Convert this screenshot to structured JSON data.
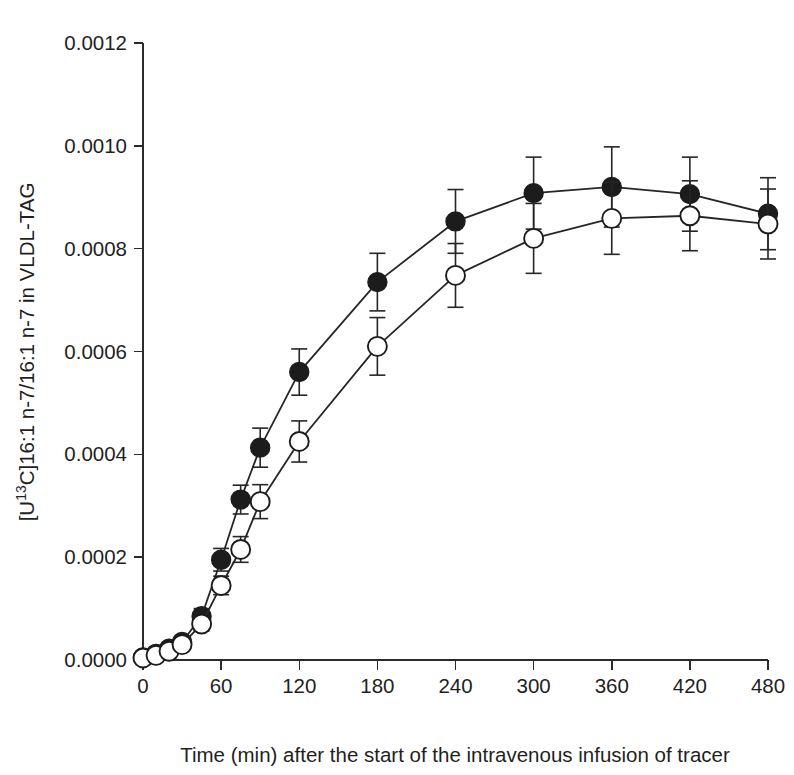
{
  "figure": {
    "background_color": "#ffffff",
    "line_color": "#262626",
    "axis_color": "#2b2b2b",
    "filled_marker_color": "#1c1c1c",
    "open_marker_fill": "#ffffff"
  },
  "chart_data": {
    "type": "line",
    "title": "",
    "subtitle": "",
    "xlabel": "Time (min) after the start of the intravenous infusion of tracer",
    "ylabel": "[U13C]16:1 n-7/16:1 n-7 in VLDL-TAG",
    "ylabel_parts": {
      "prefix": "[U",
      "superscript": "13",
      "suffix": "C]16:1 n-7/16:1 n-7 in VLDL-TAG"
    },
    "xlim": [
      0,
      480
    ],
    "ylim": [
      0.0,
      0.0012
    ],
    "grid": false,
    "legend_position": "none",
    "xticks": [
      0,
      60,
      120,
      180,
      240,
      300,
      360,
      420,
      480
    ],
    "xtick_labels": [
      "0",
      "60",
      "120",
      "180",
      "240",
      "300",
      "360",
      "420",
      "480"
    ],
    "yticks": [
      0.0,
      0.0002,
      0.0004,
      0.0006,
      0.0008,
      0.001,
      0.0012
    ],
    "ytick_labels": [
      "0.0000",
      "0.0002",
      "0.0004",
      "0.0006",
      "0.0008",
      "0.0010",
      "0.0012"
    ],
    "x": [
      0,
      10,
      20,
      30,
      45,
      60,
      75,
      90,
      120,
      180,
      240,
      300,
      360,
      420,
      480
    ],
    "series": [
      {
        "name": "filled-circles",
        "marker": "filled-circle",
        "values": [
          5e-06,
          1.2e-05,
          2.2e-05,
          3.5e-05,
          8.5e-05,
          0.000195,
          0.000312,
          0.000413,
          0.00056,
          0.000735,
          0.000853,
          0.000908,
          0.00092,
          0.000906,
          0.000868
        ],
        "errors": [
          0.0,
          0.0,
          0.0,
          0.0,
          1.5e-05,
          2.2e-05,
          2.8e-05,
          3.8e-05,
          4.5e-05,
          5.6e-05,
          6.2e-05,
          7e-05,
          7.8e-05,
          7.2e-05,
          7e-05
        ]
      },
      {
        "name": "open-circles",
        "marker": "open-circle",
        "values": [
          4e-06,
          9e-06,
          1.7e-05,
          3e-05,
          7e-05,
          0.000145,
          0.000215,
          0.000308,
          0.000425,
          0.00061,
          0.000748,
          0.00082,
          0.000859,
          0.000864,
          0.000848
        ],
        "errors": [
          0.0,
          0.0,
          0.0,
          0.0,
          1.3e-05,
          1.8e-05,
          2.5e-05,
          3.3e-05,
          4e-05,
          5.6e-05,
          6.2e-05,
          6.8e-05,
          7e-05,
          6.8e-05,
          6.8e-05
        ]
      }
    ]
  }
}
